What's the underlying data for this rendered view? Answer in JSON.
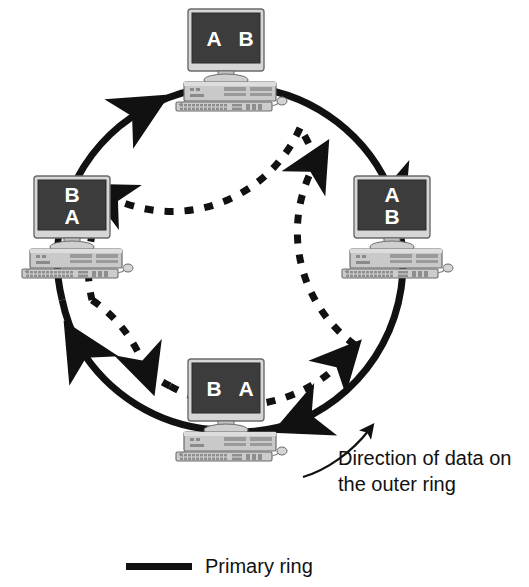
{
  "diagram": {
    "ring": {
      "center_x": 230,
      "center_y": 258,
      "outer_radius": 172,
      "inner_radius": 140,
      "outer_style": "solid",
      "inner_style": "dashed",
      "outer_direction": "clockwise",
      "inner_direction": "counter-clockwise",
      "line_color": "#111111",
      "outer_width": 7,
      "inner_width": 7
    },
    "nodes": [
      {
        "id": "node-top",
        "position": "top",
        "screen_lines": [
          "A B"
        ],
        "screen_layout": "horizontal",
        "label_a": "A",
        "label_b": "B",
        "x": 172,
        "y": 8
      },
      {
        "id": "node-right",
        "position": "right",
        "screen_lines": [
          "A",
          "B"
        ],
        "screen_layout": "vertical",
        "label_a": "A",
        "label_b": "B",
        "x": 338,
        "y": 175
      },
      {
        "id": "node-bottom",
        "position": "bottom",
        "screen_lines": [
          "B A"
        ],
        "screen_layout": "horizontal",
        "label_a": "B",
        "label_b": "A",
        "x": 172,
        "y": 358
      },
      {
        "id": "node-left",
        "position": "left",
        "screen_lines": [
          "B",
          "A"
        ],
        "screen_layout": "vertical",
        "label_a": "B",
        "label_b": "A",
        "x": 18,
        "y": 175
      }
    ],
    "annotation": {
      "line1": "Direction of data on",
      "line2": "the outer ring",
      "arrow": "curved-arrow-up-right"
    },
    "legend": {
      "items": [
        {
          "swatch_style": "solid",
          "color": "#111111",
          "label": "Primary ring"
        }
      ]
    },
    "colors": {
      "background": "#ffffff",
      "line": "#111111",
      "screen": "#3c3c3c",
      "screen_text": "#ffffff",
      "case_light": "#d8d8d8",
      "case_mid": "#b4b4b4",
      "case_dark": "#8a8a8a",
      "outline": "#5a5a5a"
    }
  }
}
